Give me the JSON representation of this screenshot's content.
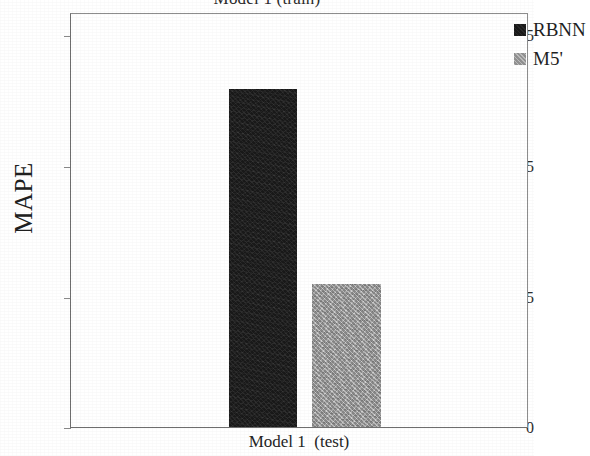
{
  "chart_data": {
    "type": "bar",
    "title": "Model 1 (train)",
    "xlabel": "Model 1  (test)",
    "ylabel": "MAPE",
    "categories": [
      "Model 1  (test)"
    ],
    "series": [
      {
        "name": "RBNN",
        "values": [
          6.44
        ],
        "color": "#191919"
      },
      {
        "name": "M5'",
        "values": [
          2.72
        ],
        "color": "#a2a2a2"
      }
    ],
    "ylim": [
      0,
      7.9
    ],
    "yticks": [
      0,
      2.5,
      5,
      7.5
    ],
    "ytick_labels": [
      "0",
      "2.5",
      "5",
      "7.5"
    ],
    "grid": false,
    "legend_position": "top-right-inside",
    "legend": [
      {
        "label": "RBNN",
        "swatch": "dark-swatch-icon"
      },
      {
        "label": "M5'",
        "swatch": "gray-swatch-icon"
      }
    ]
  },
  "axis": {
    "y_tick_0": "0",
    "y_tick_1": "2.5",
    "y_tick_2": "5",
    "y_tick_3": "7.5",
    "y_title": "MAPE",
    "x_title": "Model 1  (test)"
  },
  "legend": {
    "item_0_label": "RBNN",
    "item_1_label": "M5'"
  },
  "header": {
    "title": "Model 1 (train)"
  },
  "colors": {
    "rbnn": "#191919",
    "m5": "#a2a2a2",
    "frame": "#8d8d8d",
    "text": "#1c1c1c",
    "background": "#ffffff"
  }
}
